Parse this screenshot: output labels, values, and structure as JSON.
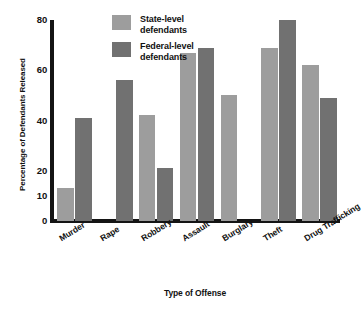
{
  "chart_data": {
    "type": "bar",
    "title": "",
    "xlabel": "Type of Offense",
    "ylabel": "Percentage of Defendants Released",
    "categories": [
      "Murder",
      "Rape",
      "Robbery",
      "Assault",
      "Burglary",
      "Theft",
      "Drug Trafficking"
    ],
    "series": [
      {
        "name": "State-level defendants",
        "color": "#9d9d9d",
        "values": [
          13,
          null,
          42,
          67,
          50,
          69,
          62
        ]
      },
      {
        "name": "Federal-level defendants",
        "color": "#717171",
        "values": [
          41,
          56,
          21,
          69,
          null,
          80,
          49
        ]
      }
    ],
    "ylim": [
      0,
      80
    ],
    "yticks": [
      0,
      10,
      20,
      40,
      60,
      80
    ],
    "ytick_labels": [
      "0",
      "10",
      "20",
      "40",
      "60",
      "80"
    ],
    "grid": false,
    "legend_position": "top-center"
  },
  "legend": {
    "items": [
      {
        "line1": "State-level",
        "line2": "defendants",
        "swatch": "state"
      },
      {
        "line1": "Federal-level",
        "line2": "defendants",
        "swatch": "federal"
      }
    ]
  }
}
